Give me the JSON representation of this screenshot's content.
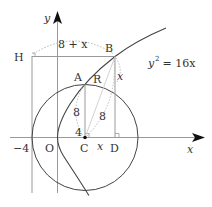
{
  "diagram": {
    "title": "",
    "equation": {
      "base": "y",
      "exp": "2",
      "rest": " = 16x"
    },
    "axes": {
      "x_label": "x",
      "y_label": "y"
    },
    "points": {
      "H": "H",
      "B": "B",
      "A": "A",
      "R": "R",
      "O": "O",
      "C": "C",
      "D": "D"
    },
    "tick_labels": {
      "minus_four": "−4"
    },
    "segment_labels": {
      "HB": "8 + x",
      "BD": "x",
      "AC": "8",
      "CB": "8",
      "CD": "x",
      "C_small": "4"
    },
    "colors": {
      "curve": "#444444",
      "axis": "#999999",
      "guide": "#aaaaaa",
      "dotted": "#bbbbbb"
    }
  }
}
